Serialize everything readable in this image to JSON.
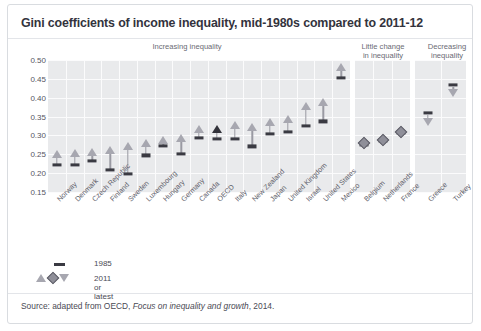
{
  "title": "Gini coefficients of income inequality, mid-1980s compared to 2011-12",
  "panel_headers": {
    "increasing": "Increasing inequality",
    "little_change": "Little change\nin inequality",
    "little_change_l1": "Little change",
    "little_change_l2": "in inequality",
    "decreasing_l1": "Decreasing",
    "decreasing_l2": "inequality"
  },
  "legend": {
    "dash_label": "1985",
    "marker_label": "2011 or latest",
    "dash_icon": "dash-icon",
    "marker_icons": [
      "triangle-up-icon",
      "diamond-icon",
      "triangle-down-icon"
    ]
  },
  "source": {
    "prefix": "Source: adapted from OECD, ",
    "italic": "Focus on inequality and growth",
    "suffix": ", 2014."
  },
  "colors": {
    "panel_bg": "#e9eaec",
    "grid": "#fbfbfc",
    "marker_open": "#a7a7b0",
    "marker_filled": "#32323a",
    "dash": "#3a3a42",
    "text": "#4a4a54",
    "border": "#d9dce0"
  },
  "chart_data": {
    "type": "scatter",
    "title": "Gini coefficients of income inequality, mid-1980s compared to 2011-12",
    "xlabel": "",
    "ylabel": "Gini coefficient",
    "ylim": [
      0.15,
      0.5
    ],
    "yticks": [
      "0.15",
      "0.20",
      "0.25",
      "0.30",
      "0.35",
      "0.40",
      "0.45",
      "0.50"
    ],
    "ytick_values": [
      0.15,
      0.2,
      0.25,
      0.3,
      0.35,
      0.4,
      0.45,
      0.5
    ],
    "grid": true,
    "legend_position": "below-left",
    "series": [
      {
        "name": "1985",
        "marker": "dash"
      },
      {
        "name": "2011 or latest",
        "marker": "triangle-up / diamond / triangle-down"
      }
    ],
    "panels": [
      {
        "name": "Increasing inequality",
        "marker_2011": "triangle-up",
        "categories": [
          "Norway",
          "Denmark",
          "Czech Republic",
          "Finland",
          "Sweden",
          "Luxembourg",
          "Hungary",
          "Germany",
          "Canada",
          "OECD",
          "Italy",
          "New Zealand",
          "Japan",
          "United Kingdom",
          "Israel",
          "United States",
          "Mexico"
        ],
        "v1985": [
          0.222,
          0.221,
          0.232,
          0.209,
          0.198,
          0.247,
          0.273,
          0.251,
          0.293,
          0.29,
          0.291,
          0.271,
          0.304,
          0.309,
          0.326,
          0.337,
          0.452
        ],
        "v2011": [
          0.25,
          0.253,
          0.256,
          0.262,
          0.273,
          0.281,
          0.289,
          0.292,
          0.316,
          0.316,
          0.327,
          0.323,
          0.336,
          0.344,
          0.377,
          0.389,
          0.482
        ],
        "highlight": "OECD"
      },
      {
        "name": "Little change in inequality",
        "marker_2011": "diamond",
        "categories": [
          "Belgium",
          "Netherlands",
          "France"
        ],
        "v1985": [
          0.274,
          0.287,
          0.308
        ],
        "v2011": [
          0.279,
          0.288,
          0.309
        ]
      },
      {
        "name": "Decreasing inequality",
        "marker_2011": "triangle-down",
        "categories": [
          "Greece",
          "Turkey"
        ],
        "v1985": [
          0.36,
          0.434
        ],
        "v2011": [
          0.335,
          0.412
        ]
      }
    ]
  }
}
